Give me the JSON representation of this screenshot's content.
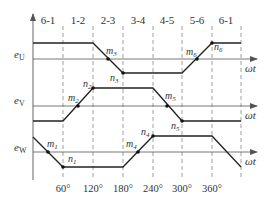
{
  "diagram": {
    "type": "three-phase trapezoidal back-EMF waveforms",
    "sector_labels": [
      "6-1",
      "1-2",
      "2-3",
      "3-4",
      "4-5",
      "5-6",
      "6-1"
    ],
    "angle_ticks": [
      "60°",
      "120°",
      "180°",
      "240°",
      "300°",
      "360°"
    ],
    "axis_label": "ωt",
    "phases": [
      {
        "name": "e",
        "sub": "U",
        "points_labels": [
          "m3",
          "n3",
          "m6",
          "n6"
        ]
      },
      {
        "name": "e",
        "sub": "V",
        "points_labels": [
          "m2",
          "n2",
          "m5",
          "n5"
        ]
      },
      {
        "name": "e",
        "sub": "W",
        "points_labels": [
          "m1",
          "n1",
          "m4",
          "n4"
        ]
      }
    ],
    "point_labels": {
      "m1": {
        "l": "m",
        "s": "1"
      },
      "n1": {
        "l": "n",
        "s": "1"
      },
      "m2": {
        "l": "m",
        "s": "2"
      },
      "n2": {
        "l": "n",
        "s": "2"
      },
      "m3": {
        "l": "m",
        "s": "3"
      },
      "n3": {
        "l": "n",
        "s": "3"
      },
      "m4": {
        "l": "m",
        "s": "4"
      },
      "n4": {
        "l": "n",
        "s": "4"
      },
      "m5": {
        "l": "m",
        "s": "5"
      },
      "n5": {
        "l": "n",
        "s": "5"
      },
      "m6": {
        "l": "m",
        "s": "6"
      },
      "n6": {
        "l": "n",
        "s": "6"
      }
    },
    "colors": {
      "waveform": "#222222",
      "axis": "#555555",
      "dashed": "#777777",
      "text": "#333333"
    }
  }
}
